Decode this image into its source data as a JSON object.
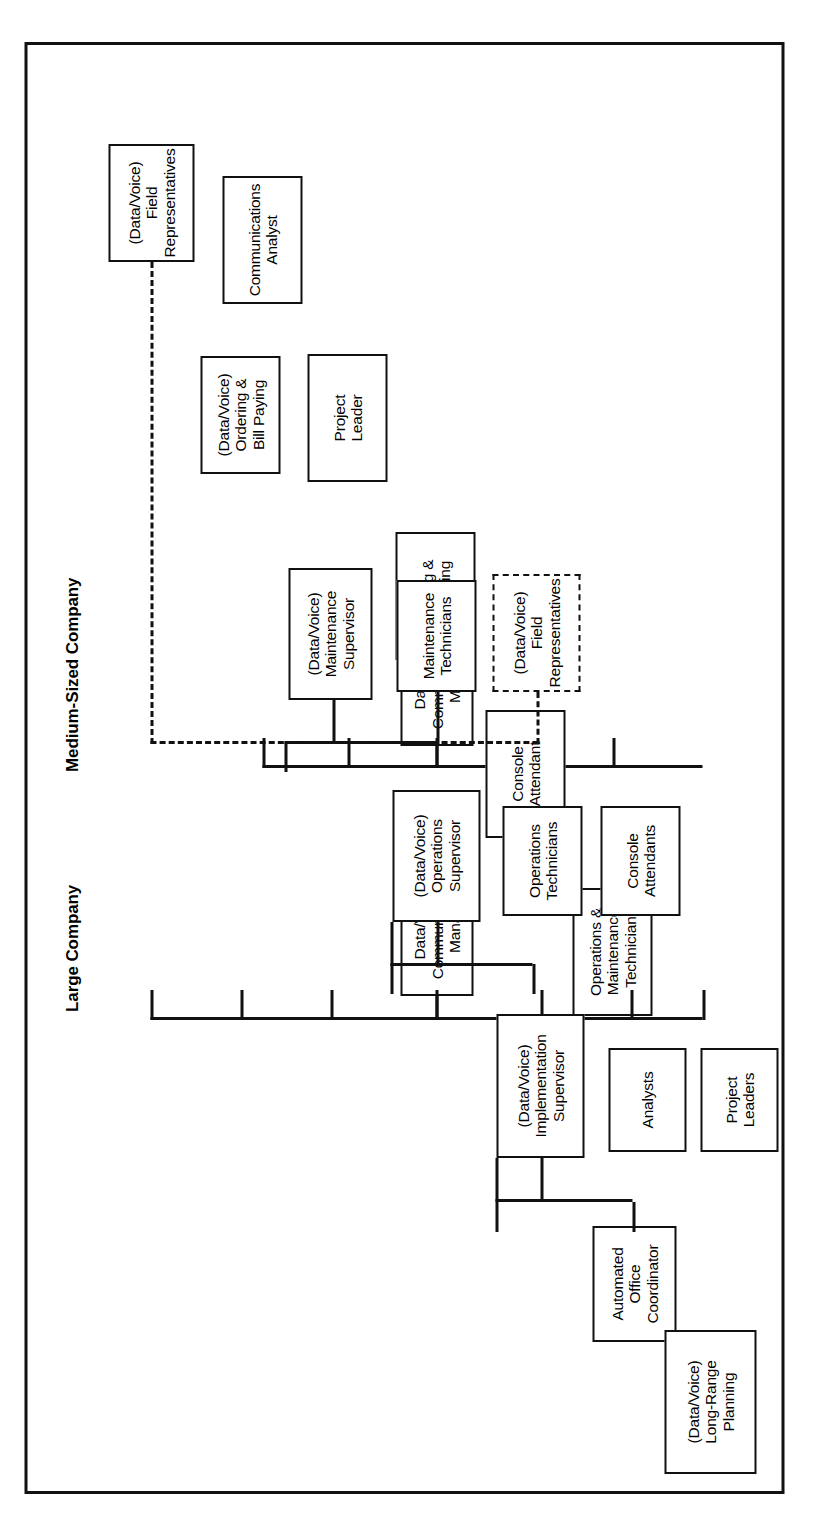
{
  "figure": {
    "sections": [
      {
        "id": "medium",
        "caption": "Medium-Sized Company",
        "root": "Data/Voice\nCommunications\nManager",
        "children": [
          "Communications\nAnalyst",
          "Project\nLeader",
          "Ordering &\nBill Paying",
          "Console\nAttendant",
          "Operations &\nMaintenance\nTechnician"
        ]
      },
      {
        "id": "large",
        "caption": "Large Company",
        "root": "Data/Voice\nCommunications\nManager",
        "children": [
          "(Data/Voice)\nLong-Range\nPlanning",
          "Automated\nOffice\nCoordinator",
          "(Data/Voice)\nImplementation\nSupervisor",
          "(Data/Voice)\nOperations\nSupervisor",
          "(Data/Voice)\nMaintenance\nSupervisor",
          "(Data/Voice)\nOrdering &\nBill Paying",
          "(Data/Voice)\nField\nRepresentatives"
        ],
        "implementation_reports": [
          "Analysts",
          "Project\nLeaders"
        ],
        "operations_reports": [
          "Operations\nTechnicians",
          "Console\nAttendants"
        ],
        "maintenance_reports": [
          "Maintenance\nTechnicians"
        ],
        "dotted_node": "(Data/Voice)\nField\nRepresentatives"
      }
    ]
  },
  "colors": {
    "ink": "#111111",
    "paper": "#ffffff"
  }
}
